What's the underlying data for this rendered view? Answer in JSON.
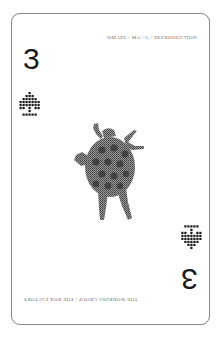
{
  "card": {
    "rank": "3",
    "suit": "spade",
    "suit_icon": "dotted-spade-icon",
    "top_caption": "OMAEL / MA / I₁ / REPRODUCTION",
    "bottom_caption": "THE WORKING GROUP / THE BOX FACTORY",
    "center_image": "halftone-dancing-figure-with-patterned-shell",
    "colors": {
      "background": "#ffffff",
      "border": "#8a8a8a",
      "ink": "#1a1a1a",
      "caption": "#6e6e6e",
      "halftone": "#4a4a4a"
    }
  }
}
